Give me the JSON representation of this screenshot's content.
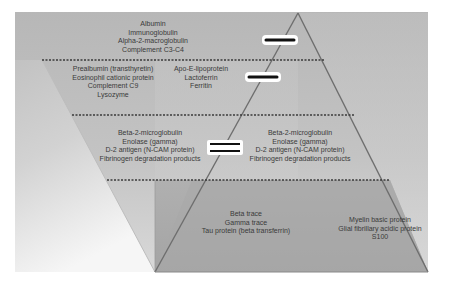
{
  "diagram": {
    "title": "",
    "colors": {
      "background_top": "#b9b9b9",
      "background_right": "#c4c4c4",
      "left_fade": "#f4f4f4",
      "bottom_panel": "#a9a9a9",
      "pyramid_edge": "#6e6e6e",
      "dashed_line": "#3a3a3a",
      "text": "#3a3a3a",
      "arrow": "#111111"
    },
    "tiers": [
      {
        "id": "tier-1",
        "left_label": [
          "Albumin",
          "Immunoglobulin",
          "Alpha-2-macroglobulin",
          "Complement C3-C4"
        ],
        "right_label": [],
        "indicator": "single-bar"
      },
      {
        "id": "tier-2",
        "left_label": [
          "Prealbumin (transthyretin)",
          "Eosinophil cationic protein",
          "Complement C9",
          "Lysozyme"
        ],
        "right_label": [
          "Apo-E-lipoprotein",
          "Lactoferrin",
          "Ferritin"
        ],
        "indicator": "single-bar"
      },
      {
        "id": "tier-3",
        "left_label": [
          "Beta-2-microglobulin",
          "Enolase (gamma)",
          "D-2 antigen (N-CAM protein)",
          "Fibrinogen degradation products"
        ],
        "right_label": [
          "Beta-2-microglobulin",
          "Enolase (gamma)",
          "D-2 antigen (N-CAM protein)",
          "Fibrinogen degradation products"
        ],
        "indicator": "equals"
      },
      {
        "id": "tier-4",
        "left_label": [
          "Beta trace",
          "Gamma trace",
          "Tau protein (beta transferrin)"
        ],
        "right_label": [
          "Myelin basic protein",
          "Glial fibrillary acidic protein",
          "S100"
        ],
        "indicator": "none"
      }
    ],
    "dividers": 3
  }
}
